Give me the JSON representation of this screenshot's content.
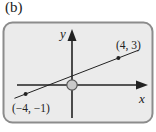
{
  "panel_label": "(b)",
  "diagram": {
    "axes": {
      "x_label": "x",
      "y_label": "y"
    },
    "line": {
      "points": [
        {
          "x": -4,
          "y": -1,
          "label": "(−4, −1)"
        },
        {
          "x": 4,
          "y": 3,
          "label": "(4, 3)"
        }
      ]
    },
    "marker": {
      "type": "open-circle",
      "at": "origin"
    },
    "colors": {
      "panel_fill": "#ebebeb",
      "panel_border": "#8c8c8c",
      "ink": "#222222",
      "marker_fill": "#c9c9c9"
    }
  }
}
